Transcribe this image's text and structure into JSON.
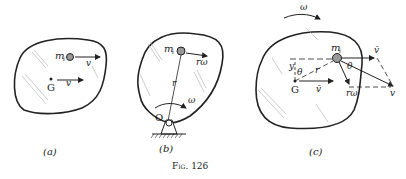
{
  "figure": {
    "caption": "Fig. 126",
    "panels": [
      {
        "id": "a",
        "label": "(a)",
        "annotations": {
          "mass": "m",
          "mass_sub": "i",
          "mass_velocity": "v",
          "center": "G",
          "center_velocity": "v"
        }
      },
      {
        "id": "b",
        "label": "(b)",
        "annotations": {
          "mass": "m",
          "mass_sub": "i",
          "mass_velocity": "rω",
          "radius": "r",
          "angular_velocity": "ω",
          "pivot": "O"
        }
      },
      {
        "id": "c",
        "label": "(c)",
        "annotations": {
          "angular_velocity": "ω",
          "mass": "m",
          "mass_sub": "i",
          "vbar_top": "v̄",
          "center": "G",
          "center_velocity": "v̄",
          "y": "y",
          "theta_left": "θ",
          "theta_right": "θ",
          "radius": "r",
          "r_omega": "rω",
          "resultant": "v"
        }
      }
    ]
  },
  "colors": {
    "ink": "#222222",
    "hatch": "#9a9a9a",
    "paper": "#ffffff"
  }
}
